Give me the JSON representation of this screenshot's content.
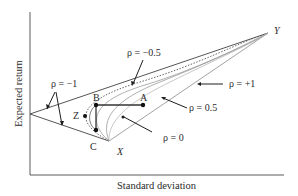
{
  "diagram": {
    "type": "portfolio-frontier",
    "axes": {
      "x_label": "Standard deviation",
      "y_label": "Expected return"
    },
    "points": {
      "X": "X",
      "Y": "Y",
      "A": "A",
      "B": "B",
      "C": "C",
      "Z": "Z"
    },
    "curve_labels": {
      "rho_minus_1": "ρ = −1",
      "rho_minus_05": "ρ = −0.5",
      "rho_plus_1": "ρ = +1",
      "rho_05": "ρ = 0.5",
      "rho_0": "ρ = 0"
    },
    "colors": {
      "axis": "#5a5a5a",
      "line": "#4a4a4a",
      "curve": "#9a9a9a",
      "arrow": "#1e1e1e",
      "point": "#111111"
    }
  }
}
